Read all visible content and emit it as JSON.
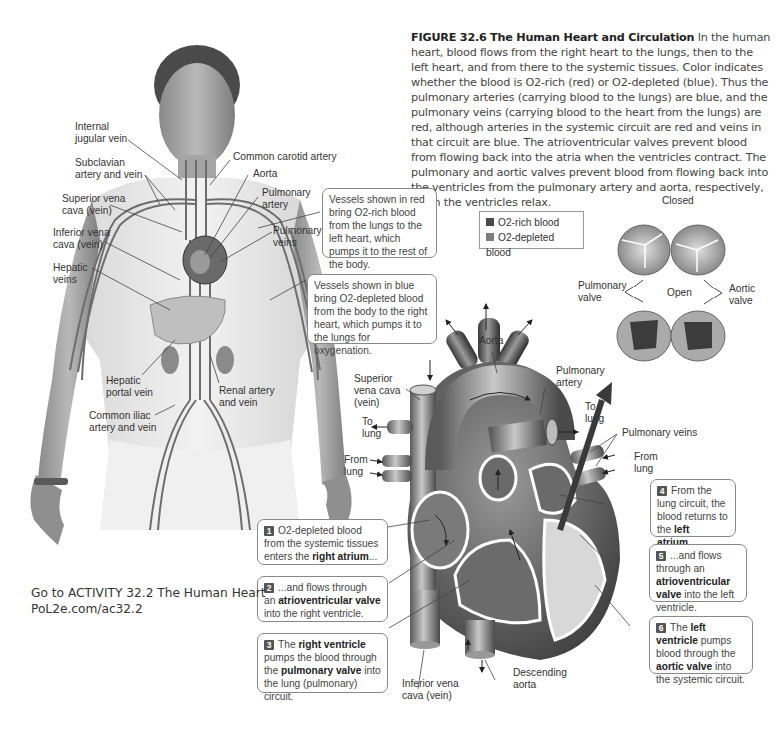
{
  "caption": {
    "figure_number": "FIGURE 32.6",
    "figure_title": "The Human Heart and Circulation",
    "text": "In the human heart, blood flows from the right heart to the lungs, then to the left heart, and from there to the systemic tissues. Color indicates whether the blood is O2-rich (red) or O2-depleted (blue). Thus the pulmonary arteries (carrying blood to the lungs) are blue, and the pulmonary veins (carrying blood to the heart from the lungs) are red, although arteries in the systemic circuit are red and veins in that circuit are blue. The atrioventricular valves prevent blood from flowing back into the atria when the ventricles contract. The pulmonary and aortic valves prevent blood from flowing back into the ventricles from the pulmonary artery and aorta, respectively, when the ventricles relax."
  },
  "body_labels": {
    "internal_jugular_1": "Internal",
    "internal_jugular_2": "jugular vein",
    "subclavian_1": "Subclavian",
    "subclavian_2": "artery and vein",
    "svc_1": "Superior vena",
    "svc_2": "cava (vein)",
    "ivc_1": "Inferior vena",
    "ivc_2": "cava (vein)",
    "hepatic_veins_1": "Hepatic",
    "hepatic_veins_2": "veins",
    "carotid": "Common carotid artery",
    "aorta": "Aorta",
    "pulm_artery_1": "Pulmonary",
    "pulm_artery_2": "artery",
    "pulm_veins_1": "Pulmonary",
    "pulm_veins_2": "veins",
    "hepatic_portal_1": "Hepatic",
    "hepatic_portal_2": "portal vein",
    "renal_1": "Renal artery",
    "renal_2": "and vein",
    "iliac_1": "Common iliac",
    "iliac_2": "artery and vein"
  },
  "callouts": {
    "red_vessels": "Vessels shown in red bring O2-rich blood from the lungs to the left heart, which pumps it to the rest of the body.",
    "blue_vessels": "Vessels shown in blue bring O2-depleted blood from the body to the right heart, which pumps it to the lungs for oxygenation."
  },
  "legend": {
    "items": [
      {
        "label": "O2-rich blood",
        "color": "#c0392b"
      },
      {
        "label": "O2-depleted blood",
        "color": "#3b6fb6"
      }
    ]
  },
  "valves": {
    "closed": "Closed",
    "open": "Open",
    "pulmonary_1": "Pulmonary",
    "pulmonary_2": "valve",
    "aortic_1": "Aortic",
    "aortic_2": "valve"
  },
  "heart_labels": {
    "aorta": "Aorta",
    "svc_1": "Superior",
    "svc_2": "vena cava",
    "svc_3": "(vein)",
    "pulm_artery_1": "Pulmonary",
    "pulm_artery_2": "artery",
    "to_lung_left_1": "To",
    "to_lung_left_2": "lung",
    "to_lung_right_1": "To",
    "to_lung_right_2": "lung",
    "from_lung_left_1": "From",
    "from_lung_left_2": "lung",
    "from_lung_right_1": "From",
    "from_lung_right_2": "lung",
    "pulm_veins": "Pulmonary veins",
    "ivc_1": "Inferior vena",
    "ivc_2": "cava (vein)",
    "desc_aorta_1": "Descending",
    "desc_aorta_2": "aorta"
  },
  "steps": [
    {
      "num": "1",
      "pre": "O2-depleted blood from the systemic tissues enters the ",
      "bold": "right atrium",
      "post": "...",
      "bold2": "",
      "post2": ""
    },
    {
      "num": "2",
      "pre": "...and flows through an ",
      "bold": "atrioventricular valve",
      "post": " into the right ventricle.",
      "bold2": "",
      "post2": ""
    },
    {
      "num": "3",
      "pre": "The ",
      "bold": "right ventricle",
      "post": " pumps the blood through the ",
      "bold2": "pulmonary valve",
      "post2": " into the lung (pulmonary) circuit."
    },
    {
      "num": "4",
      "pre": "From the lung circuit, the blood returns to the ",
      "bold": "left atrium",
      "post": "...",
      "bold2": "",
      "post2": ""
    },
    {
      "num": "5",
      "pre": "...and flows through an ",
      "bold": "atrioventricular valve",
      "post": " into the left ventricle.",
      "bold2": "",
      "post2": ""
    },
    {
      "num": "6",
      "pre": "The ",
      "bold": "left ventricle",
      "post": " pumps blood through the ",
      "bold2": "aortic valve",
      "post2": " into the systemic circuit."
    }
  ],
  "activity": {
    "line1": "Go to ACTIVITY 32.2  The Human Heart",
    "line2": "PoL2e.com/ac32.2"
  }
}
